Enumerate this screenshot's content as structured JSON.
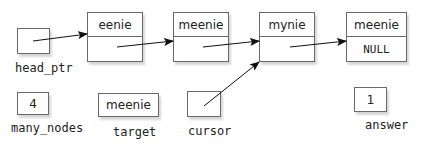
{
  "nodes": [
    {
      "data": "eenie",
      "link": ""
    },
    {
      "data": "meenie",
      "link": ""
    },
    {
      "data": "mynie",
      "link": ""
    },
    {
      "data": "meenie",
      "link": "NULL"
    }
  ],
  "variables": {
    "head_ptr": {
      "label": "head_ptr",
      "value": ""
    },
    "many_nodes": {
      "label": "many_nodes",
      "value": "4"
    },
    "target": {
      "label": "target",
      "value": "meenie"
    },
    "cursor": {
      "label": "cursor",
      "value": ""
    },
    "answer": {
      "label": "answer",
      "value": "1"
    }
  },
  "arrows": [
    {
      "from": "head_ptr",
      "to": "node-0"
    },
    {
      "from": "node-0",
      "to": "node-1"
    },
    {
      "from": "node-1",
      "to": "node-2"
    },
    {
      "from": "node-2",
      "to": "node-3"
    },
    {
      "from": "cursor",
      "to": "node-2"
    }
  ],
  "colors": {
    "line": "#6a6a6a",
    "arrow": "#111111",
    "text": "#222222"
  }
}
